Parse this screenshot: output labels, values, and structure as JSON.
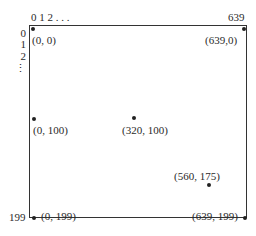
{
  "axes": {
    "x_ticks_label": "0 1 2 . . .",
    "x_max_label": "639",
    "y_ticks": [
      "0",
      "1",
      "2",
      "⋮"
    ],
    "y_max_label": "199"
  },
  "points": [
    {
      "label": "(0, 0)",
      "x": 0,
      "y": 0
    },
    {
      "label": "(639,0)",
      "x": 639,
      "y": 0
    },
    {
      "label": "(0, 100)",
      "x": 0,
      "y": 100
    },
    {
      "label": "(320, 100)",
      "x": 320,
      "y": 100
    },
    {
      "label": "(560, 175)",
      "x": 560,
      "y": 175
    },
    {
      "label": "(0, 199)",
      "x": 0,
      "y": 199
    },
    {
      "label": "(639, 199)",
      "x": 639,
      "y": 199
    }
  ]
}
